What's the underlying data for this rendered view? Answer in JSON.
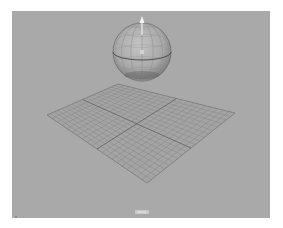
{
  "app": "Maya",
  "viewport": {
    "camera_label": "persp",
    "background_color": "#a9a9a9",
    "objects": [
      {
        "type": "sphere",
        "name": "pSphere1",
        "center": [
          130,
          41
        ],
        "radius": 29,
        "selected": true
      },
      {
        "type": "plane",
        "name": "pPlane1",
        "subdivisions": 20
      }
    ],
    "manipulator": {
      "type": "move-y-arrow"
    },
    "axis_indicator": {
      "x_color": "#cc3333",
      "y_color": "#33aa33",
      "z_color": "#3355cc"
    }
  }
}
